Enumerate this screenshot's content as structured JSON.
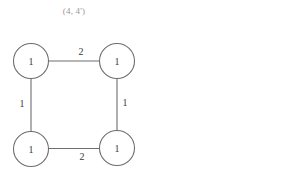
{
  "title": "(4, 4')",
  "colors": {
    "stroke": "#6e6e6e",
    "text": "#3a3a3a",
    "title": "#9a9a9a",
    "background": "#ffffff"
  },
  "graph": {
    "nodes": [
      {
        "id": "top-left",
        "label": "1",
        "cx": 31,
        "cy": 61,
        "r": 17.5
      },
      {
        "id": "top-right",
        "label": "1",
        "cx": 117,
        "cy": 61,
        "r": 17.5
      },
      {
        "id": "bottom-left",
        "label": "1",
        "cx": 31,
        "cy": 149,
        "r": 17.5
      },
      {
        "id": "bottom-right",
        "label": "1",
        "cx": 117,
        "cy": 148,
        "r": 17.5
      }
    ],
    "edges": [
      {
        "from": "top-left",
        "to": "top-right",
        "weight": "2",
        "position": "top"
      },
      {
        "from": "top-left",
        "to": "bottom-left",
        "weight": "1",
        "position": "left"
      },
      {
        "from": "top-right",
        "to": "bottom-right",
        "weight": "1",
        "position": "right"
      },
      {
        "from": "bottom-left",
        "to": "bottom-right",
        "weight": "2",
        "position": "bottom"
      }
    ]
  }
}
